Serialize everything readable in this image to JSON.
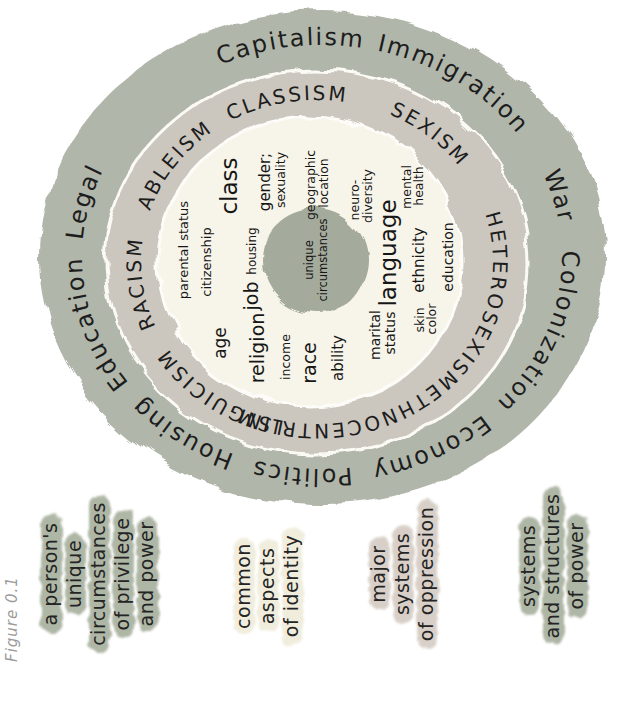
{
  "caption": "Figure 0.1",
  "colors": {
    "outer_ring": "#b1b6aa",
    "middle_ring": "#cbc7bf",
    "inner_disc": "#f7f4ea",
    "center_circle": "#a5ab9c",
    "highlight_green": "#a8b09e",
    "highlight_cream": "#efecdb",
    "highlight_pink": "#d5cdc4",
    "ink": "#1d1d1d",
    "caption_gray": "#9b9b9b"
  },
  "wheel": {
    "outer_words": [
      "Education",
      "Legal",
      "Capitalism",
      "Immigration",
      "War",
      "Colonization",
      "Economy",
      "Politics",
      "Housing"
    ],
    "middle_words": [
      "RACISM",
      "ABLEISM",
      "CLASSISM",
      "SEXISM",
      "HETEROSEXISM",
      "ETHNOCENTRISM",
      "LINGUICISM"
    ],
    "center": {
      "lines": [
        "unique",
        "circumstances"
      ]
    },
    "identity": [
      {
        "label": "parental status",
        "lines": [
          "parental status"
        ]
      },
      {
        "label": "citizenship",
        "lines": [
          "citizenship"
        ]
      },
      {
        "label": "class",
        "lines": [
          "class"
        ]
      },
      {
        "label": "age",
        "lines": [
          "age"
        ]
      },
      {
        "label": "religion",
        "lines": [
          "religion"
        ]
      },
      {
        "label": "income",
        "lines": [
          "income"
        ]
      },
      {
        "label": "job",
        "lines": [
          "job"
        ]
      },
      {
        "label": "housing",
        "lines": [
          "housing"
        ]
      },
      {
        "label": "gender; sexuality",
        "lines": [
          "gender;",
          "sexuality"
        ]
      },
      {
        "label": "race",
        "lines": [
          "race"
        ]
      },
      {
        "label": "ability",
        "lines": [
          "ability"
        ]
      },
      {
        "label": "geographic location",
        "lines": [
          "geographic",
          "location"
        ]
      },
      {
        "label": "neuro-diversity",
        "lines": [
          "neuro-",
          "diversity"
        ]
      },
      {
        "label": "mental health",
        "lines": [
          "mental",
          "health"
        ]
      },
      {
        "label": "language",
        "lines": [
          "language"
        ]
      },
      {
        "label": "ethnicity",
        "lines": [
          "ethnicity"
        ]
      },
      {
        "label": "education",
        "lines": [
          "education"
        ]
      },
      {
        "label": "marital status",
        "lines": [
          "marital",
          "status"
        ]
      },
      {
        "label": "skin color",
        "lines": [
          "skin",
          "color"
        ]
      }
    ]
  },
  "legend": {
    "groups": [
      {
        "name": "a person's unique circumstances of privilege and power",
        "lines": [
          "a person's",
          "unique",
          "circumstances",
          "of privilege",
          "and power"
        ]
      },
      {
        "name": "common aspects of identity",
        "lines": [
          "common",
          "aspects",
          "of identity"
        ]
      },
      {
        "name": "major systems of oppression",
        "lines": [
          "major",
          "systems",
          "of oppression"
        ]
      },
      {
        "name": "systems and structures of power",
        "lines": [
          "systems",
          "and structures",
          "of power"
        ]
      }
    ]
  }
}
